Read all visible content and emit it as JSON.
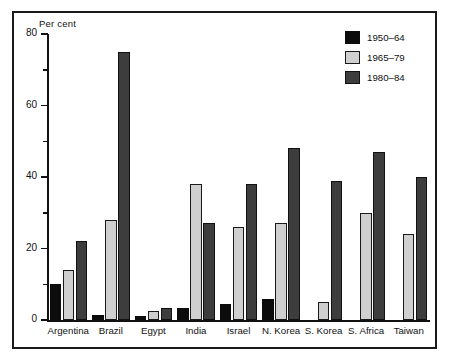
{
  "chart_data": {
    "type": "bar",
    "title": "",
    "subtitle": "",
    "xlabel": "",
    "ylabel": "Per cent",
    "ylim": [
      0,
      80
    ],
    "yticks": [
      0,
      20,
      40,
      60,
      80
    ],
    "ytick_labels": [
      "0",
      "20",
      "40",
      "60",
      "80"
    ],
    "yminor_ticks": [
      10,
      30,
      50,
      70
    ],
    "grid": false,
    "legend_position": "top-right",
    "categories": [
      "Argentina",
      "Brazil",
      "Egypt",
      "India",
      "Israel",
      "N. Korea",
      "S. Korea",
      "S. Africa",
      "Taiwan"
    ],
    "series": [
      {
        "name": "1950-64",
        "color": "#0c0c0c",
        "values": [
          10,
          1.5,
          1,
          3.5,
          4.5,
          6,
          null,
          null,
          null
        ]
      },
      {
        "name": "1965-79",
        "color": "#cfcfcf",
        "values": [
          14,
          28,
          2.5,
          38,
          26,
          27,
          5,
          30,
          24
        ]
      },
      {
        "name": "1980-84",
        "color": "#3d3d3d",
        "values": [
          22,
          75,
          3.5,
          27,
          38,
          48,
          39,
          47,
          40
        ]
      }
    ]
  },
  "legend": {
    "items": [
      {
        "label": "1950–64",
        "swatch": "s0"
      },
      {
        "label": "1965–79",
        "swatch": "s1"
      },
      {
        "label": "1980–84",
        "swatch": "s2"
      }
    ]
  },
  "axes": {
    "y_axis_title": "Per cent",
    "y_tick_labels": [
      "80",
      "60",
      "40",
      "20",
      "0"
    ],
    "x_tick_labels": [
      "Argentina",
      "Brazil",
      "Egypt",
      "India",
      "Israel",
      "N. Korea",
      "S. Korea",
      "S. Africa",
      "Taiwan"
    ]
  },
  "colors": {
    "series_1950_64": "#0c0c0c",
    "series_1965_79": "#cfcfcf",
    "series_1980_84": "#3d3d3d",
    "axis": "#111111",
    "frame": "#1a1a1a",
    "background": "#ffffff"
  }
}
